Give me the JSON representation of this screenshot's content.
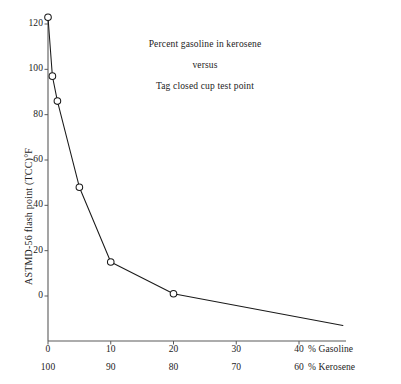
{
  "chart_data": {
    "type": "line",
    "title": "Percent gasoline in kerosene versus Tag closed cup test point",
    "title_lines": [
      "Percent gasoline in kerosene",
      "versus",
      "Tag closed cup test point"
    ],
    "xlabel": "% Gasoline",
    "xlabel_secondary": "% Kerosene",
    "ylabel": "ASTMD-56 flash point (TCC)°F",
    "xlim": [
      0,
      47
    ],
    "ylim": [
      -14,
      128
    ],
    "grid": false,
    "legend": false,
    "marker": "open-circle",
    "line_color": "#1a1a1a",
    "axis_color": "#4a4a4a",
    "xticks": [
      "0",
      "10",
      "20",
      "30",
      "40"
    ],
    "xtick_values": [
      0,
      10,
      20,
      30,
      40
    ],
    "xticks_secondary": [
      "100",
      "90",
      "80",
      "70",
      "60"
    ],
    "xtick_secondary_values": [
      100,
      90,
      80,
      70,
      60
    ],
    "yticks": [
      "0",
      "20",
      "40",
      "60",
      "80",
      "100",
      "120"
    ],
    "ytick_values": [
      0,
      20,
      40,
      60,
      80,
      100,
      120
    ],
    "x": [
      0,
      0.7,
      1.5,
      5,
      10,
      20,
      47
    ],
    "values": [
      123,
      97,
      86,
      48,
      15,
      1,
      -13
    ],
    "points": [
      {
        "x": 0,
        "y": 123,
        "marker": true
      },
      {
        "x": 0.7,
        "y": 97,
        "marker": true
      },
      {
        "x": 1.5,
        "y": 86,
        "marker": true
      },
      {
        "x": 5,
        "y": 48,
        "marker": true
      },
      {
        "x": 10,
        "y": 15,
        "marker": true
      },
      {
        "x": 20,
        "y": 1,
        "marker": true
      },
      {
        "x": 47,
        "y": -13,
        "marker": false
      }
    ]
  }
}
